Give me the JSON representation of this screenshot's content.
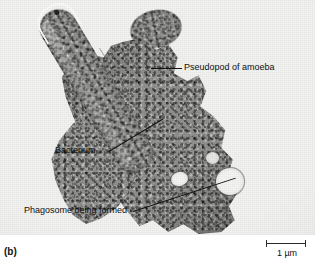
{
  "figure": {
    "panel_letter": "(b)",
    "type": "electron micrograph"
  },
  "labels": {
    "pseudopod": "Pseudopod of amoeba",
    "bacterium": "Bacterium",
    "phagosome": "Phagosome being formed"
  },
  "scale_bar": {
    "value": "1 µm"
  },
  "colors": {
    "plate_background": "#f2f2f1",
    "cytoplasm": "#8d8d8c",
    "vacuole": "#f4f4f3",
    "text": "#111111",
    "leader_line": "#111111",
    "scale_bar": "#2b2b2b"
  }
}
